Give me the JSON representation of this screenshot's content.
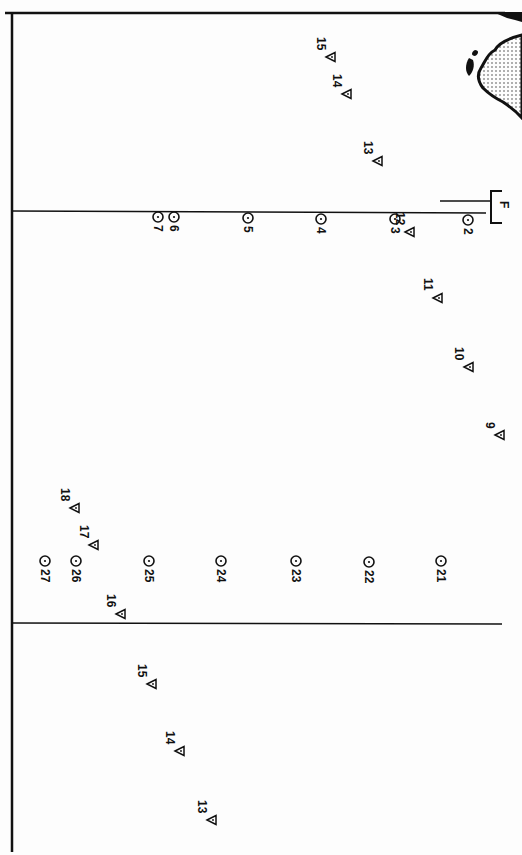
{
  "map": {
    "frame": {
      "stroke": "#111111"
    },
    "marker_types": {
      "circle": "station-circle-dot",
      "triangle": "station-triangle"
    },
    "feature_label": "F",
    "lines": [
      {
        "name": "top-border",
        "x1": 5,
        "y1": 13,
        "x2": 505,
        "y2": 13
      },
      {
        "name": "left-border",
        "x1": 12,
        "y1": 12,
        "x2": 12,
        "y2": 852
      },
      {
        "name": "transect-upper",
        "x1": 12,
        "y1": 211,
        "x2": 486,
        "y2": 213
      },
      {
        "name": "transect-lower",
        "x1": 12,
        "y1": 623,
        "x2": 502,
        "y2": 624
      },
      {
        "name": "f-pointer",
        "x1": 440,
        "y1": 201,
        "x2": 490,
        "y2": 201
      }
    ],
    "circles": [
      {
        "id": "7",
        "x": 158,
        "y": 217
      },
      {
        "id": "6",
        "x": 174,
        "y": 217
      },
      {
        "id": "5",
        "x": 248,
        "y": 218
      },
      {
        "id": "4",
        "x": 321,
        "y": 219
      },
      {
        "id": "3",
        "x": 395,
        "y": 219
      },
      {
        "id": "2",
        "x": 468,
        "y": 220
      },
      {
        "id": "27",
        "x": 45,
        "y": 561
      },
      {
        "id": "26",
        "x": 76,
        "y": 561
      },
      {
        "id": "25",
        "x": 149,
        "y": 561
      },
      {
        "id": "24",
        "x": 221,
        "y": 561
      },
      {
        "id": "23",
        "x": 296,
        "y": 561
      },
      {
        "id": "22",
        "x": 369,
        "y": 562
      },
      {
        "id": "21",
        "x": 441,
        "y": 561
      }
    ],
    "triangles": [
      {
        "id": "15",
        "x": 331,
        "y": 57,
        "group": "upper"
      },
      {
        "id": "14",
        "x": 347,
        "y": 94,
        "group": "upper"
      },
      {
        "id": "13",
        "x": 378,
        "y": 161,
        "group": "upper"
      },
      {
        "id": "12",
        "x": 410,
        "y": 232,
        "group": "middle"
      },
      {
        "id": "11",
        "x": 438,
        "y": 298,
        "group": "middle"
      },
      {
        "id": "10",
        "x": 469,
        "y": 367,
        "group": "middle"
      },
      {
        "id": "9",
        "x": 500,
        "y": 435,
        "group": "middle"
      },
      {
        "id": "18",
        "x": 75,
        "y": 508,
        "group": "middle"
      },
      {
        "id": "17",
        "x": 94,
        "y": 545,
        "group": "middle"
      },
      {
        "id": "16",
        "x": 121,
        "y": 614,
        "group": "middle"
      },
      {
        "id": "15",
        "x": 152,
        "y": 684,
        "group": "lower"
      },
      {
        "id": "14",
        "x": 180,
        "y": 751,
        "group": "lower"
      },
      {
        "id": "13",
        "x": 212,
        "y": 820,
        "group": "lower"
      }
    ]
  }
}
